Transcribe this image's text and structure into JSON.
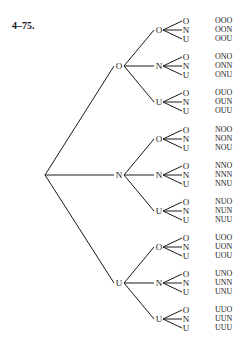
{
  "title": "4–75.",
  "tree": {
    "root": {
      "x": 45,
      "y": 175
    },
    "branch_labels": [
      "O",
      "N",
      "U"
    ],
    "level1": [
      {
        "label": "O",
        "x": 119,
        "y": 66
      },
      {
        "label": "N",
        "x": 119,
        "y": 175
      },
      {
        "label": "U",
        "x": 119,
        "y": 283
      }
    ],
    "level2": [
      {
        "label": "O",
        "x": 159,
        "y": 30
      },
      {
        "label": "N",
        "x": 159,
        "y": 66
      },
      {
        "label": "U",
        "x": 159,
        "y": 102
      },
      {
        "label": "O",
        "x": 159,
        "y": 139
      },
      {
        "label": "N",
        "x": 159,
        "y": 175
      },
      {
        "label": "U",
        "x": 159,
        "y": 211
      },
      {
        "label": "O",
        "x": 159,
        "y": 247
      },
      {
        "label": "N",
        "x": 159,
        "y": 283
      },
      {
        "label": "U",
        "x": 159,
        "y": 319
      }
    ],
    "leaf_offsets": [
      -9,
      0,
      9
    ],
    "leaf_x": 186,
    "outcome_x": 215,
    "outcomes": [
      "OOO",
      "OON",
      "OOU",
      "ONO",
      "ONN",
      "ONU",
      "OUO",
      "OUN",
      "OUU",
      "NOO",
      "NON",
      "NOU",
      "NNO",
      "NNN",
      "NNU",
      "NUO",
      "NUN",
      "NUU",
      "UOO",
      "UON",
      "UOU",
      "UNO",
      "UNN",
      "UNU",
      "UUO",
      "UUN",
      "UUU"
    ]
  },
  "colors": {
    "line": "#1a1a1a",
    "text": "#1a1a1a",
    "background": "#ffffff"
  }
}
